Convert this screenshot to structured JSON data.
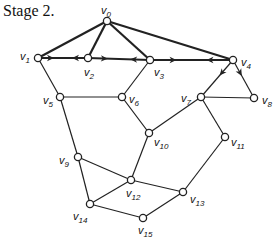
{
  "title": "Stage 2.",
  "colors": {
    "line": "#222222",
    "node_fill": "#ffffff",
    "bg": "#ffffff"
  },
  "nodes": [
    {
      "id": "v0",
      "x": 107,
      "y": 21,
      "label": "v",
      "sub": "0",
      "lx": 101,
      "ly": 14
    },
    {
      "id": "v1",
      "x": 38,
      "y": 58,
      "label": "v",
      "sub": "1",
      "lx": 20,
      "ly": 60
    },
    {
      "id": "v2",
      "x": 88,
      "y": 58,
      "label": "v",
      "sub": "2",
      "lx": 84,
      "ly": 76
    },
    {
      "id": "v3",
      "x": 150,
      "y": 60,
      "label": "v",
      "sub": "3",
      "lx": 154,
      "ly": 76
    },
    {
      "id": "v4",
      "x": 233,
      "y": 60,
      "label": "v",
      "sub": "4",
      "lx": 241,
      "ly": 66
    },
    {
      "id": "v5",
      "x": 60,
      "y": 97,
      "label": "v",
      "sub": "5",
      "lx": 43,
      "ly": 104
    },
    {
      "id": "v6",
      "x": 122,
      "y": 97,
      "label": "v",
      "sub": "6",
      "lx": 129,
      "ly": 103
    },
    {
      "id": "v7",
      "x": 201,
      "y": 97,
      "label": "v",
      "sub": "7",
      "lx": 181,
      "ly": 102
    },
    {
      "id": "v8",
      "x": 254,
      "y": 98,
      "label": "v",
      "sub": "8",
      "lx": 262,
      "ly": 104
    },
    {
      "id": "v9",
      "x": 78,
      "y": 157,
      "label": "v",
      "sub": "9",
      "lx": 59,
      "ly": 164
    },
    {
      "id": "v10",
      "x": 149,
      "y": 133,
      "label": "v",
      "sub": "10",
      "lx": 154,
      "ly": 146
    },
    {
      "id": "v11",
      "x": 225,
      "y": 137,
      "label": "v",
      "sub": "11",
      "lx": 231,
      "ly": 146
    },
    {
      "id": "v12",
      "x": 131,
      "y": 180,
      "label": "v",
      "sub": "12",
      "lx": 126,
      "ly": 197
    },
    {
      "id": "v13",
      "x": 183,
      "y": 192,
      "label": "v",
      "sub": "13",
      "lx": 190,
      "ly": 203
    },
    {
      "id": "v14",
      "x": 90,
      "y": 204,
      "label": "v",
      "sub": "14",
      "lx": 73,
      "ly": 220
    },
    {
      "id": "v15",
      "x": 143,
      "y": 218,
      "label": "v",
      "sub": "15",
      "lx": 138,
      "ly": 234
    }
  ],
  "edges": [
    {
      "a": "v0",
      "b": "v1",
      "bold": true
    },
    {
      "a": "v0",
      "b": "v2",
      "bold": true
    },
    {
      "a": "v0",
      "b": "v3",
      "bold": true
    },
    {
      "a": "v0",
      "b": "v4",
      "bold": true
    },
    {
      "a": "v1",
      "b": "v2",
      "bold": true,
      "arrows": "both-out"
    },
    {
      "a": "v2",
      "b": "v3",
      "bold": true,
      "arrows": "both-out"
    },
    {
      "a": "v3",
      "b": "v4",
      "bold": true,
      "arrows": "both-out"
    },
    {
      "a": "v4",
      "b": "v7",
      "bold": false,
      "arrows": "from-a"
    },
    {
      "a": "v4",
      "b": "v8",
      "bold": false,
      "arrows": "from-a"
    },
    {
      "a": "v1",
      "b": "v5"
    },
    {
      "a": "v5",
      "b": "v6"
    },
    {
      "a": "v3",
      "b": "v6"
    },
    {
      "a": "v6",
      "b": "v10"
    },
    {
      "a": "v7",
      "b": "v10"
    },
    {
      "a": "v7",
      "b": "v8"
    },
    {
      "a": "v7",
      "b": "v11"
    },
    {
      "a": "v5",
      "b": "v9"
    },
    {
      "a": "v9",
      "b": "v12"
    },
    {
      "a": "v9",
      "b": "v14"
    },
    {
      "a": "v10",
      "b": "v12"
    },
    {
      "a": "v12",
      "b": "v13"
    },
    {
      "a": "v12",
      "b": "v14"
    },
    {
      "a": "v11",
      "b": "v13"
    },
    {
      "a": "v14",
      "b": "v15"
    },
    {
      "a": "v15",
      "b": "v13"
    }
  ]
}
